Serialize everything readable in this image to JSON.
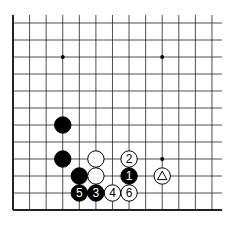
{
  "diagram": {
    "type": "go-board-partial",
    "grid": {
      "cols": 13,
      "rows": 12,
      "x0": 13,
      "dx": 16.58,
      "y0": 23,
      "dy": 17.0,
      "right_extent": 222,
      "top_extent": 15,
      "thick_edges": [
        "left",
        "bottom"
      ],
      "line_color": "#222222"
    },
    "hoshi": [
      {
        "col": 3,
        "row": 2
      },
      {
        "col": 9,
        "row": 2
      },
      {
        "col": 9,
        "row": 8
      }
    ],
    "stones": [
      {
        "color": "black",
        "col": 3,
        "row": 6,
        "label": ""
      },
      {
        "color": "black",
        "col": 3,
        "row": 8,
        "label": ""
      },
      {
        "color": "white",
        "col": 5,
        "row": 8,
        "label": ""
      },
      {
        "color": "white",
        "col": 7,
        "row": 8,
        "label": "2"
      },
      {
        "color": "black",
        "col": 4,
        "row": 9,
        "label": ""
      },
      {
        "color": "white",
        "col": 5,
        "row": 9,
        "label": ""
      },
      {
        "color": "black",
        "col": 7,
        "row": 9,
        "label": "1"
      },
      {
        "color": "white",
        "col": 9,
        "row": 9,
        "label": "",
        "marker": "triangle"
      },
      {
        "color": "black",
        "col": 4,
        "row": 10,
        "label": "5"
      },
      {
        "color": "black",
        "col": 5,
        "row": 10,
        "label": "3"
      },
      {
        "color": "white",
        "col": 6,
        "row": 10,
        "label": "4"
      },
      {
        "color": "white",
        "col": 7,
        "row": 10,
        "label": "6"
      }
    ]
  }
}
